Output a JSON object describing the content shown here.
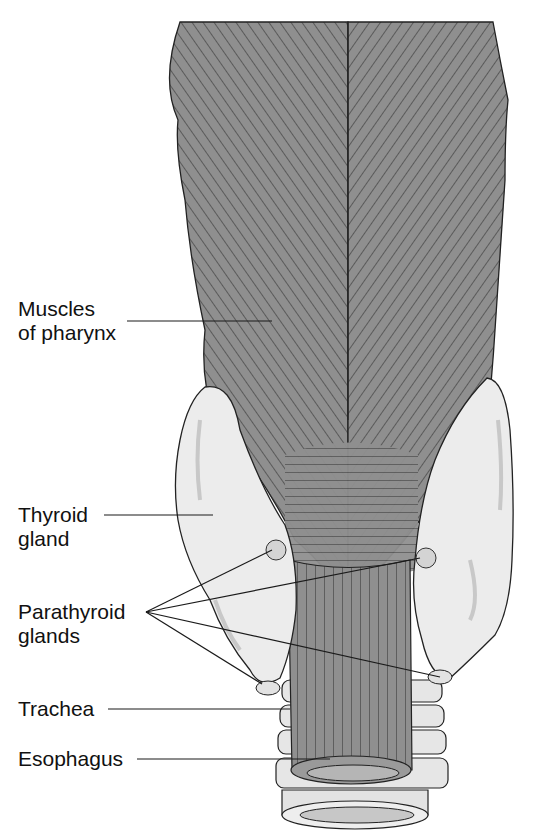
{
  "diagram": {
    "view": "posterior view of pharynx with thyroid and parathyroid glands",
    "colors": {
      "muscle": "#8f8f8f",
      "muscle_lines": "#2a2a2a",
      "gland": "#ececec",
      "gland_shadow": "#c8c8c8",
      "cartilage": "#e6e6e6",
      "outline": "#222222",
      "background": "#ffffff"
    },
    "labels": [
      {
        "id": "muscles",
        "line1": "Muscles",
        "line2": "of pharynx"
      },
      {
        "id": "thyroid",
        "line1": "Thyroid",
        "line2": "gland"
      },
      {
        "id": "parathyroid",
        "line1": "Parathyroid",
        "line2": "glands"
      },
      {
        "id": "trachea",
        "line1": "Trachea"
      },
      {
        "id": "esophagus",
        "line1": "Esophagus"
      }
    ]
  }
}
